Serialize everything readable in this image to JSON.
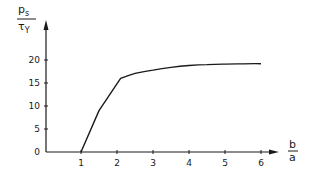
{
  "chart_data": {
    "type": "line",
    "title": "",
    "ylabel": {
      "numerator": "p",
      "numerator_sub": "s",
      "denominator": "τ",
      "denominator_sub": "Y"
    },
    "xlabel": {
      "numerator": "b",
      "denominator": "a"
    },
    "xlim": [
      0,
      6.5
    ],
    "ylim": [
      0,
      25
    ],
    "x_ticks": [
      "1",
      "2",
      "3",
      "4",
      "5",
      "6"
    ],
    "y_ticks": [
      "0",
      "5",
      "10",
      "15",
      "20"
    ],
    "grid": false,
    "legend": null,
    "series": [
      {
        "name": "ps/τY",
        "x": [
          1.0,
          1.5,
          2.1,
          2.5,
          3.0,
          3.5,
          4.0,
          4.5,
          5.0,
          5.5,
          6.0
        ],
        "values": [
          0,
          9,
          16,
          17.1,
          17.8,
          18.4,
          18.8,
          19.0,
          19.1,
          19.15,
          19.2
        ]
      }
    ]
  }
}
